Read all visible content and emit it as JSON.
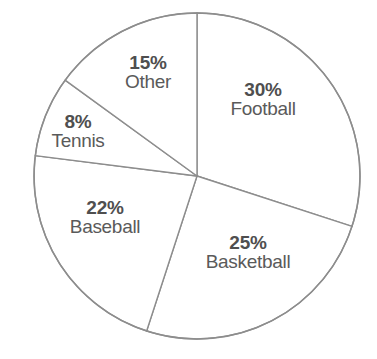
{
  "chart_data": {
    "type": "pie",
    "title": "",
    "xlabel": "",
    "ylabel": "",
    "legend_position": "none",
    "grid": false,
    "start_angle_deg": 0,
    "direction": "clockwise",
    "units": "percent",
    "total": 100,
    "categories": [
      "Football",
      "Basketball",
      "Baseball",
      "Tennis",
      "Other"
    ],
    "values": [
      30,
      25,
      22,
      8,
      15
    ],
    "slices": [
      {
        "label": "Football",
        "value": 30,
        "pct_text": "30%",
        "start_deg": 0,
        "end_deg": 108,
        "label_x": 263,
        "label_y": 99,
        "color": "#ffffff"
      },
      {
        "label": "Basketball",
        "value": 25,
        "pct_text": "25%",
        "start_deg": 108,
        "end_deg": 198,
        "label_x": 248,
        "label_y": 252,
        "color": "#ffffff"
      },
      {
        "label": "Baseball",
        "value": 22,
        "pct_text": "22%",
        "start_deg": 198,
        "end_deg": 277.2,
        "label_x": 105,
        "label_y": 217,
        "color": "#ffffff"
      },
      {
        "label": "Tennis",
        "value": 8,
        "pct_text": "8%",
        "start_deg": 277.2,
        "end_deg": 306,
        "label_x": 78,
        "label_y": 131,
        "color": "#ffffff"
      },
      {
        "label": "Other",
        "value": 15,
        "pct_text": "15%",
        "start_deg": 306,
        "end_deg": 360,
        "label_x": 148,
        "label_y": 72,
        "color": "#ffffff"
      }
    ],
    "geometry": {
      "center_x": 197,
      "center_y": 176,
      "radius": 163
    },
    "style": {
      "background": "#ffffff",
      "stroke": "#8d8d8d",
      "pct_color": "#4f4f4f",
      "name_color": "#5a5a5a"
    }
  }
}
